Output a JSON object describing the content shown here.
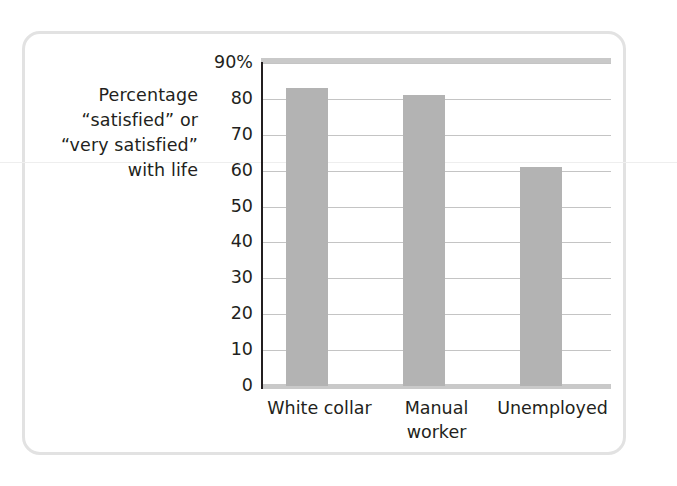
{
  "figure": {
    "frame_color": "#e2e2e2",
    "background": "#ffffff"
  },
  "axis_title": {
    "line1": "Percentage",
    "line2": "“satisfied” or",
    "line3": "“very satisfied”",
    "line4": "with life"
  },
  "chart_data": {
    "type": "bar",
    "title": "",
    "subtitle": "",
    "xlabel": "",
    "ylabel": "Percentage “satisfied” or “very satisfied” with life",
    "categories": [
      "White collar",
      "Manual worker",
      "Unemployed"
    ],
    "category_label_lines": [
      [
        "White collar"
      ],
      [
        "Manual",
        "worker"
      ],
      [
        "Unemployed"
      ]
    ],
    "values": [
      83,
      81,
      61
    ],
    "ylim": [
      0,
      90
    ],
    "yticks": [
      0,
      10,
      20,
      30,
      40,
      50,
      60,
      70,
      80,
      90
    ],
    "ytick_labels": [
      "0",
      "10",
      "20",
      "30",
      "40",
      "50",
      "60",
      "70",
      "80",
      "90%"
    ],
    "grid": true,
    "grid_axis": "y",
    "legend": false,
    "legend_position": "none",
    "bar_color": "#b3b3b3",
    "gridline_color": "#c4c4c4",
    "axis_color": "#231f20",
    "text_color": "#231f20"
  }
}
